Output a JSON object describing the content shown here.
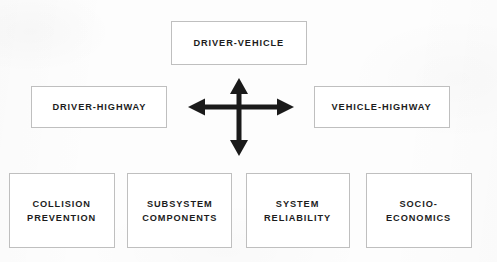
{
  "diagram": {
    "background_color": "#fdfdfd",
    "box_border_color": "#bfbfbf",
    "box_fill_color": "#ffffff",
    "text_color": "#1c1c1c",
    "arrow_color": "#1a1a1a",
    "interaction_nodes": [
      {
        "id": "driver-vehicle",
        "label": "DRIVER-VEHICLE",
        "position": "top"
      },
      {
        "id": "driver-highway",
        "label": "DRIVER-HIGHWAY",
        "position": "left"
      },
      {
        "id": "vehicle-highway",
        "label": "VEHICLE-HIGHWAY",
        "position": "right"
      }
    ],
    "center_arrow": {
      "name": "four-headed-cross-arrow",
      "directions": [
        "up",
        "down",
        "left",
        "right"
      ],
      "color": "#1a1a1a"
    },
    "domain_nodes": [
      {
        "id": "collision-prevention",
        "label": "COLLISION\nPREVENTION"
      },
      {
        "id": "subsystem-components",
        "label": "SUBSYSTEM\nCOMPONENTS"
      },
      {
        "id": "system-reliability",
        "label": "SYSTEM\nRELIABILITY"
      },
      {
        "id": "socio-economics",
        "label": "SOCIO-\nECONOMICS"
      }
    ]
  }
}
